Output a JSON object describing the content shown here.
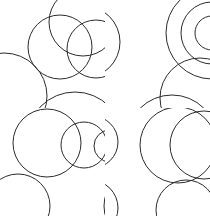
{
  "figure": {
    "title": "",
    "background_color": "#ffffff",
    "stroke_color": "#2b2b2b",
    "stroke_width": 1,
    "width": 210,
    "height": 216,
    "grid": {
      "rows": 2,
      "cols": 2
    }
  },
  "chart_data": {
    "type": "scatter",
    "title": "",
    "subtitle": "",
    "xlabel": "",
    "ylabel": "",
    "grid": false,
    "legend": "none",
    "xlim": [
      0,
      210
    ],
    "ylim": [
      0,
      216
    ],
    "panels": [
      {
        "name": "top-left",
        "label": "venn-three-circles",
        "bounds": {
          "x": 0,
          "y": 0,
          "width": 105,
          "height": 108
        },
        "shapes": [
          {
            "name": "circle-top",
            "cx": 83,
            "cy": 22,
            "r": 34
          },
          {
            "name": "circle-left",
            "cx": 60,
            "cy": 47,
            "r": 32
          },
          {
            "name": "circle-right",
            "cx": 96,
            "cy": 49,
            "r": 29
          },
          {
            "name": "arc-edge-left",
            "cx": 4,
            "cy": 96,
            "r": 43
          },
          {
            "name": "arc-edge-right",
            "cx": 160,
            "cy": 96,
            "r": 52
          },
          {
            "name": "arc-edge-bottom",
            "cx": 75,
            "cy": 140,
            "r": 48
          }
        ]
      },
      {
        "name": "top-right",
        "label": "concentric-circles",
        "bounds": {
          "x": 105,
          "y": 0,
          "width": 105,
          "height": 108
        },
        "shapes": [
          {
            "name": "circle-outer",
            "cx": 212,
            "cy": 33,
            "r": 46
          },
          {
            "name": "circle-middle",
            "cx": 212,
            "cy": 33,
            "r": 31
          },
          {
            "name": "circle-inner",
            "cx": 212,
            "cy": 33,
            "r": 17
          },
          {
            "name": "arc-edge-left",
            "cx": 84,
            "cy": 42,
            "r": 36
          },
          {
            "name": "arc-edge-lower",
            "cx": 200,
            "cy": 98,
            "r": 40
          },
          {
            "name": "arc-edge-bottom",
            "cx": 172,
            "cy": 140,
            "r": 45
          }
        ]
      },
      {
        "name": "bottom-left",
        "label": "decreasing-circle-chain",
        "bounds": {
          "x": 0,
          "y": 108,
          "width": 105,
          "height": 108
        },
        "shapes": [
          {
            "name": "circle-large",
            "cx": 47,
            "cy": 143,
            "r": 34
          },
          {
            "name": "circle-medium",
            "cx": 84,
            "cy": 145,
            "r": 23
          },
          {
            "name": "circle-small",
            "cx": 110,
            "cy": 146,
            "r": 16
          },
          {
            "name": "arc-edge-top",
            "cx": 56,
            "cy": 64,
            "r": 40
          },
          {
            "name": "arc-edge-bottom-left",
            "cx": 18,
            "cy": 206,
            "r": 32
          },
          {
            "name": "arc-edge-bottom-right",
            "cx": 140,
            "cy": 206,
            "r": 36
          }
        ]
      },
      {
        "name": "bottom-right",
        "label": "crescent-overlap",
        "bounds": {
          "x": 105,
          "y": 108,
          "width": 105,
          "height": 108
        },
        "shapes": [
          {
            "name": "circle-base",
            "cx": 178,
            "cy": 145,
            "r": 38
          },
          {
            "name": "circle-cutter",
            "cx": 204,
            "cy": 145,
            "r": 34
          },
          {
            "name": "arc-edge-left-upper",
            "cx": 92,
            "cy": 142,
            "r": 26
          },
          {
            "name": "arc-edge-top",
            "cx": 168,
            "cy": 66,
            "r": 42
          },
          {
            "name": "arc-edge-bottom-left",
            "cx": 90,
            "cy": 208,
            "r": 28
          },
          {
            "name": "arc-edge-bottom-right",
            "cx": 186,
            "cy": 210,
            "r": 30
          }
        ]
      }
    ]
  }
}
